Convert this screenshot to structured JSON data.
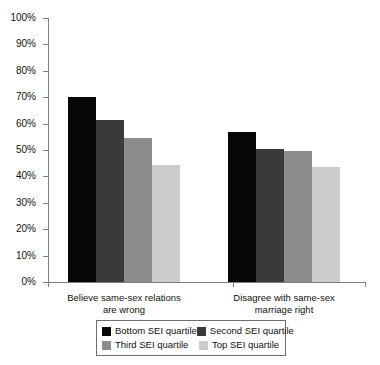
{
  "chart_data": {
    "type": "bar",
    "title": "",
    "subtitle": "",
    "xlabel": "",
    "ylabel": "",
    "ylim": [
      0,
      100
    ],
    "grid": false,
    "legend_position": "bottom",
    "categories": [
      "Believe same-sex relations\nare wrong",
      "Disagree with same-sex\nmarriage right"
    ],
    "y_ticks": [
      "0%",
      "10%",
      "20%",
      "30%",
      "40%",
      "50%",
      "60%",
      "70%",
      "80%",
      "90%",
      "100%"
    ],
    "y_tick_values": [
      0,
      10,
      20,
      30,
      40,
      50,
      60,
      70,
      80,
      90,
      100
    ],
    "series": [
      {
        "name": "Bottom SEI quartile",
        "color": "#070707",
        "values": [
          70,
          57
        ]
      },
      {
        "name": "Second SEI quartile",
        "color": "#3a3a3a",
        "values": [
          61.5,
          50.5
        ]
      },
      {
        "name": "Third SEI quartile",
        "color": "#8c8c8c",
        "values": [
          54.5,
          49.5
        ]
      },
      {
        "name": "Top SEI quartile",
        "color": "#cccccc",
        "values": [
          44.5,
          43.5
        ]
      }
    ]
  },
  "legend": {
    "entries": [
      {
        "label": "Bottom SEI quartile",
        "color": "#070707"
      },
      {
        "label": "Second SEI quartile",
        "color": "#3a3a3a"
      },
      {
        "label": "Third SEI quartile",
        "color": "#8c8c8c"
      },
      {
        "label": "Top SEI quartile",
        "color": "#cccccc"
      }
    ]
  },
  "axis": {
    "line_color": "#808080"
  }
}
